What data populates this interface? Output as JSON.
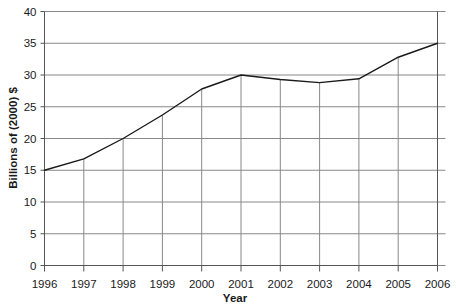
{
  "chart_data": {
    "type": "line",
    "title": "",
    "xlabel": "Year",
    "ylabel": "Billions of (2000) $",
    "categories": [
      "1996",
      "1997",
      "1998",
      "1999",
      "2000",
      "2001",
      "2002",
      "2003",
      "2004",
      "2005",
      "2006"
    ],
    "x": [
      1996,
      1997,
      1998,
      1999,
      2000,
      2001,
      2002,
      2003,
      2004,
      2005,
      2006
    ],
    "values": [
      15.0,
      16.8,
      20.0,
      23.7,
      27.8,
      30.0,
      29.3,
      28.8,
      29.4,
      32.8,
      35.0
    ],
    "series": [
      {
        "name": "Billions of (2000) $",
        "values": [
          15.0,
          16.8,
          20.0,
          23.7,
          27.8,
          30.0,
          29.3,
          28.8,
          29.4,
          32.8,
          35.0
        ]
      }
    ],
    "ylim": [
      0,
      40
    ],
    "ytick_step": 5,
    "yticks": [
      0,
      5,
      10,
      15,
      20,
      25,
      30,
      35,
      40
    ],
    "ytick_labels": [
      "0",
      "5",
      "10",
      "15",
      "20",
      "25",
      "30",
      "35",
      "40"
    ],
    "grid": "horizontal-full-and-vertical-below-line",
    "legend": "none",
    "line_color": "#1a1a1a",
    "grid_color": "#888888",
    "axis_color": "#555555",
    "background_color": "#ffffff"
  },
  "axes": {
    "y_title": "Billions of (2000) $",
    "x_title": "Year"
  }
}
